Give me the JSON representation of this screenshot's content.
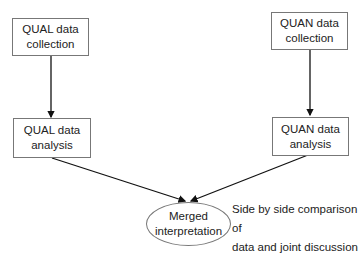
{
  "diagram": {
    "nodes": {
      "qual_collection": {
        "line1": "QUAL data",
        "line2": "collection"
      },
      "qual_analysis": {
        "line1": "QUAL data",
        "line2": "analysis"
      },
      "quan_collection": {
        "line1": "QUAN data",
        "line2": "collection"
      },
      "quan_analysis": {
        "line1": "QUAN data",
        "line2": "analysis"
      },
      "merged": {
        "line1": "Merged",
        "line2": "interpretation"
      }
    },
    "annotation": {
      "line1": "Side by side comparison of",
      "line2": "data and joint discussion"
    },
    "edges": [
      {
        "from": "qual_collection",
        "to": "qual_analysis"
      },
      {
        "from": "quan_collection",
        "to": "quan_analysis"
      },
      {
        "from": "qual_analysis",
        "to": "merged"
      },
      {
        "from": "quan_analysis",
        "to": "merged"
      }
    ],
    "colors": {
      "line": "#111111",
      "border": "#777777"
    }
  }
}
